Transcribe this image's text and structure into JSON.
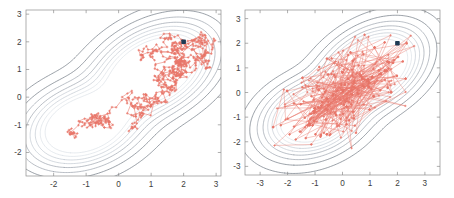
{
  "figure": {
    "width": 454,
    "height": 198,
    "background": "#ffffff",
    "panel_count": 2
  },
  "colors": {
    "trace": "#e8766a",
    "trace_light": "#ef9b90",
    "contour_dark": "#5b6470",
    "contour_mid": "#8e96a0",
    "contour_light": "#b9c2cb",
    "contour_faint": "#d6dde3",
    "axis": "#8d8d8d",
    "tick_label": "#3d3d3d",
    "start_marker": "#1f3b54"
  },
  "chart_data": [
    {
      "type": "line",
      "title": "",
      "subtitle": "",
      "xlabel": "",
      "ylabel": "",
      "panel": "left",
      "panel_name": "random-walk-metropolis-hastings",
      "grid": false,
      "legend": "none",
      "xlim": [
        -2.85,
        3.15
      ],
      "ylim": [
        -2.85,
        3.15
      ],
      "xticks": [
        -2,
        -1,
        0,
        1,
        2,
        3
      ],
      "yticks": [
        -2,
        -1,
        0,
        1,
        2,
        3
      ],
      "xticklabels": [
        "-2",
        "-1",
        "0",
        "1",
        "2",
        "3"
      ],
      "yticklabels": [
        "-2",
        "-1",
        "0",
        "1",
        "2",
        "3"
      ],
      "annotations": [
        {
          "name": "start-marker",
          "x": 2.0,
          "y": 2.0,
          "marker": "filled-square",
          "color": "#1f3b54"
        }
      ],
      "series": [
        {
          "name": "contour-levels",
          "type": "contour",
          "levels": [
            0.005,
            0.02,
            0.045,
            0.08,
            0.12,
            0.17,
            0.23,
            0.3
          ],
          "description": "bimodal density, modes near (1.0, 0.9) and (-1.0, -1.0)"
        },
        {
          "name": "mcmc-trace",
          "type": "path-with-markers",
          "color": "#e8766a",
          "n_samples": 600,
          "step_scale": 0.12,
          "description": "local random-walk chain clustered around the upper-right mode",
          "x": [
            2.0,
            1.92,
            1.86,
            1.78,
            1.72,
            1.66,
            1.62,
            1.58,
            1.52,
            1.48,
            1.42,
            1.38,
            1.35,
            1.3,
            1.27,
            1.22,
            1.18,
            1.14,
            1.09,
            1.05,
            1.01,
            0.97,
            0.93,
            0.9,
            0.86,
            0.82,
            0.78,
            0.74,
            0.7,
            0.66
          ],
          "y": [
            2.0,
            2.02,
            1.98,
            2.04,
            2.0,
            1.94,
            1.9,
            1.84,
            1.86,
            1.8,
            1.76,
            1.72,
            1.68,
            1.64,
            1.6,
            1.56,
            1.52,
            1.48,
            1.44,
            1.4,
            1.36,
            1.32,
            1.28,
            1.24,
            1.2,
            1.16,
            1.12,
            1.08,
            1.04,
            1.0
          ]
        }
      ]
    },
    {
      "type": "line",
      "title": "",
      "subtitle": "",
      "xlabel": "",
      "ylabel": "",
      "panel": "right",
      "panel_name": "independence-sampler",
      "grid": false,
      "legend": "none",
      "xlim": [
        -3.55,
        3.55
      ],
      "ylim": [
        -3.35,
        3.35
      ],
      "xticks": [
        -3,
        -2,
        -1,
        0,
        1,
        2,
        3
      ],
      "yticks": [
        -3,
        -2,
        -1,
        0,
        1,
        2,
        3
      ],
      "xticklabels": [
        "-3",
        "-2",
        "-1",
        "0",
        "1",
        "2",
        "3"
      ],
      "yticklabels": [
        "-3",
        "-2",
        "-1",
        "0",
        "1",
        "2",
        "3"
      ],
      "annotations": [
        {
          "name": "start-marker",
          "x": 2.0,
          "y": 2.0,
          "marker": "filled-square",
          "color": "#1f3b54"
        }
      ],
      "series": [
        {
          "name": "contour-levels",
          "type": "contour",
          "levels": [
            0.005,
            0.02,
            0.045,
            0.08,
            0.12,
            0.17,
            0.23,
            0.3
          ],
          "description": "same bimodal density, modes near (1.0, 0.9) and (-1.0, -1.0)"
        },
        {
          "name": "mcmc-trace",
          "type": "path-with-markers",
          "color": "#e8766a",
          "n_samples": 600,
          "step_scale": 2.2,
          "description": "independence sampler with long global jumps spanning the full support",
          "x": [
            2.0,
            0.4,
            -1.3,
            1.1,
            -2.6,
            0.8,
            1.9,
            -0.6,
            0.2,
            1.4,
            -1.8,
            0.9,
            2.4,
            -0.3,
            0.6
          ],
          "y": [
            2.0,
            0.1,
            -1.6,
            1.3,
            -0.9,
            -0.4,
            1.1,
            0.7,
            -2.1,
            0.3,
            1.7,
            -1.2,
            0.5,
            -0.7,
            1.0
          ]
        }
      ]
    }
  ]
}
